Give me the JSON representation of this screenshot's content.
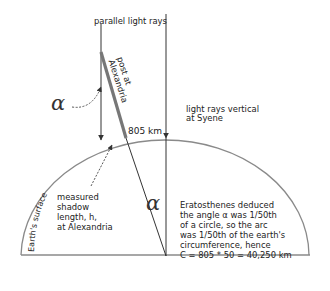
{
  "labels": {
    "parallel_rays": "parallel light rays",
    "post_line1": "post at",
    "post_line2": "Alexandria",
    "alpha_symbol": "α",
    "distance": "805 km",
    "syene_line1": "light rays vertical",
    "syene_line2": "at Syene",
    "earth_surface": "Earth's surface",
    "shadow_lines": [
      "measured",
      "shadow",
      "length, h,",
      "at Alexandria"
    ],
    "explanation_lines": [
      "Eratosthenes  deduced",
      "the angle α was 1/50th",
      "of a circle, so the arc",
      "was 1/50th of the earth's",
      "circumference, hence",
      "C = 805 * 50 = 40,250 km"
    ]
  },
  "values": {
    "distance_km": 805,
    "fraction_of_circle": "1/50",
    "multiplier": 50,
    "circumference_km": 40250
  },
  "colors": {
    "line": "#333333",
    "post": "#777777",
    "arc": "#888888",
    "text": "#222222"
  }
}
